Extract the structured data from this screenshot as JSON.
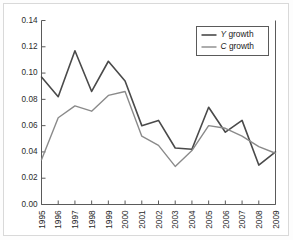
{
  "chart_data": {
    "type": "line",
    "title": "",
    "xlabel": "",
    "ylabel": "",
    "grid": false,
    "legend_position": "top-right",
    "categories": [
      "1995",
      "1996",
      "1997",
      "1998",
      "1999",
      "2000",
      "2001",
      "2002",
      "2003",
      "2004",
      "2005",
      "2006",
      "2007",
      "2008",
      "2009"
    ],
    "x": [
      1995,
      1996,
      1997,
      1998,
      1999,
      2000,
      2001,
      2002,
      2003,
      2004,
      2005,
      2006,
      2007,
      2008,
      2009
    ],
    "xlim": [
      1995,
      2009
    ],
    "ylim": [
      0.0,
      0.14
    ],
    "ytick_labels": [
      "0.00",
      "0.02",
      "0.04",
      "0.06",
      "0.08",
      "0.10",
      "0.12",
      "0.14"
    ],
    "ytick_values": [
      0.0,
      0.02,
      0.04,
      0.06,
      0.08,
      0.1,
      0.12,
      0.14
    ],
    "series": [
      {
        "name": "Y growth",
        "name_italic_prefix": "Y",
        "name_rest": " growth",
        "color": "#4a4a4a",
        "width": 1.6,
        "values": [
          0.097,
          0.082,
          0.117,
          0.086,
          0.109,
          0.094,
          0.06,
          0.064,
          0.043,
          0.042,
          0.074,
          0.055,
          0.064,
          0.03,
          0.04
        ]
      },
      {
        "name": "C growth",
        "name_italic_prefix": "C",
        "name_rest": " growth",
        "color": "#8a8a8a",
        "width": 1.4,
        "values": [
          0.034,
          0.066,
          0.075,
          0.071,
          0.083,
          0.086,
          0.052,
          0.045,
          0.029,
          0.041,
          0.06,
          0.058,
          0.052,
          0.044,
          0.039
        ]
      }
    ]
  },
  "figure": {
    "background_color": "#ffffff",
    "border_color": "#d9d9d9",
    "axis_color": "#5a5a5a"
  }
}
